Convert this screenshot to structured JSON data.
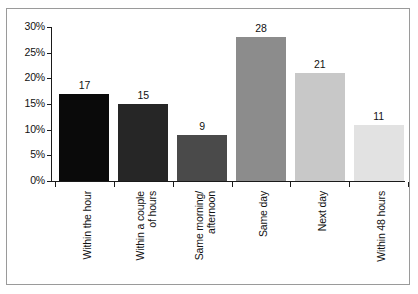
{
  "chart_data": {
    "type": "bar",
    "title": "",
    "subtitle": "",
    "xlabel": "",
    "ylabel": "",
    "ylim": [
      0,
      30
    ],
    "ytick_labels": [
      "0%",
      "5%",
      "10%",
      "15%",
      "20%",
      "25%",
      "30%"
    ],
    "ytick_values": [
      0,
      5,
      10,
      15,
      20,
      25,
      30
    ],
    "grid": false,
    "legend": "none",
    "categories": [
      "Within the hour",
      "Within a couple\nof hours",
      "Same morning/\nafternoon",
      "Same day",
      "Next day",
      "Within 48 hours"
    ],
    "values": [
      17,
      15,
      9,
      28,
      21,
      11
    ],
    "data_labels": [
      "17",
      "15",
      "9",
      "28",
      "21",
      "11"
    ],
    "bar_colors": [
      "#0a0a0a",
      "#262626",
      "#4a4a4a",
      "#8c8c8c",
      "#c8c8c8",
      "#e2e2e2"
    ],
    "value_unit": "%",
    "axis_color": "#1a1a1a",
    "frame_color": "#9a9a9a",
    "background_color": "#ffffff"
  }
}
